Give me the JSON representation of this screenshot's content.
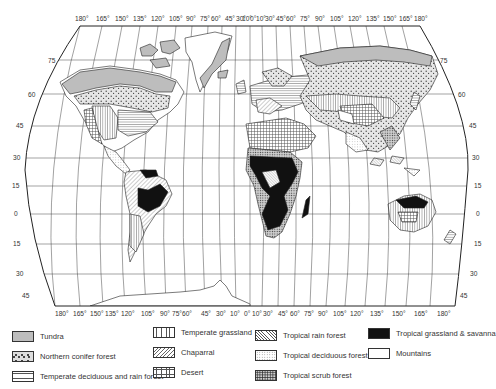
{
  "map": {
    "title": "World biomes map",
    "top_longitude_labels": [
      "180°",
      "165°",
      "150°",
      "135°",
      "120°",
      "105°",
      "90°",
      "75°",
      "60°",
      "45°",
      "30°",
      "10°",
      "0°",
      "10°",
      "30°",
      "45°",
      "60°",
      "75°",
      "90°",
      "105°",
      "120°",
      "135°",
      "150°",
      "165°",
      "180°"
    ],
    "bottom_longitude_labels": [
      "180°",
      "165°",
      "150°",
      "135°",
      "120°",
      "105°",
      "90°",
      "75°",
      "60°",
      "45°",
      "30°",
      "10°",
      "0°",
      "10°",
      "30°",
      "45°",
      "60°",
      "75°",
      "90°",
      "105°",
      "120°",
      "135°",
      "150°",
      "165°",
      "180°"
    ],
    "left_latitude_labels": [
      "75",
      "60",
      "45",
      "30",
      "15",
      "0",
      "15",
      "30",
      "45",
      "60"
    ],
    "right_latitude_labels": [
      "75",
      "60",
      "45",
      "30",
      "15",
      "0",
      "15",
      "30",
      "45",
      "60"
    ]
  },
  "legend": {
    "items": [
      {
        "key": "tundra",
        "label": "Tundra"
      },
      {
        "key": "northern_conifer_forest",
        "label": "Northern conifer forest"
      },
      {
        "key": "temperate_deciduous_rain_forest",
        "label": "Temperate deciduous and rain forest"
      },
      {
        "key": "temperate_grassland",
        "label": "Temperate grassland"
      },
      {
        "key": "chaparral",
        "label": "Chaparral"
      },
      {
        "key": "desert",
        "label": "Desert"
      },
      {
        "key": "tropical_rain_forest",
        "label": "Tropical rain forest"
      },
      {
        "key": "tropical_deciduous_forest",
        "label": "Tropical deciduous forest"
      },
      {
        "key": "tropical_scrub_forest",
        "label": "Tropical scrub forest"
      },
      {
        "key": "tropical_grassland_savanna",
        "label": "Tropical grassland & savanna"
      },
      {
        "key": "mountains",
        "label": "Mountains"
      }
    ]
  },
  "colors": {
    "tundra": "#bdbdbd",
    "savanna": "#111111",
    "line": "#333333",
    "background": "#ffffff"
  }
}
